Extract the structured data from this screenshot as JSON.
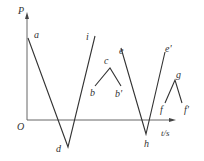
{
  "diagram": {
    "y_axis_label": "P",
    "x_axis_label": "t/s",
    "origin_label": "O",
    "points": {
      "a": "a",
      "d": "d",
      "i": "i",
      "b": "b",
      "c": "c",
      "b_prime": "b'",
      "e": "e",
      "h": "h",
      "e_prime": "e'",
      "f": "f",
      "g": "g",
      "f_prime": "f'"
    },
    "line_color": "#333333",
    "axis_color": "#666666"
  }
}
